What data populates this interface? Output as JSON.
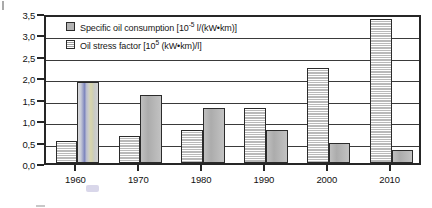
{
  "chart_data": {
    "type": "bar",
    "title": "",
    "subtitle": "",
    "xlabel": "",
    "ylabel": "",
    "categories": [
      "1960",
      "1970",
      "1980",
      "1990",
      "2000",
      "2010"
    ],
    "series": [
      {
        "name": "Oil stress factor [10⁵ (kW•km)/l]",
        "pattern": "striped",
        "values": [
          0.52,
          0.63,
          0.78,
          1.28,
          2.22,
          3.35
        ]
      },
      {
        "name": "Specific oil consumption [10⁻⁵ l/(kW•km)]",
        "pattern": "solid",
        "values": [
          1.88,
          1.58,
          1.28,
          0.78,
          0.47,
          0.3
        ]
      }
    ],
    "ylim": [
      0.0,
      3.5
    ],
    "ytick_values": [
      0.0,
      0.5,
      1.0,
      1.5,
      2.0,
      2.5,
      3.0,
      3.5
    ],
    "ytick_labels": [
      "0,0",
      "0,5",
      "1,0",
      "1,5",
      "2,0",
      "2,5",
      "3,0",
      "3,5"
    ],
    "grid": true,
    "grid_axis": "y",
    "legend_position": "top-left",
    "decimal_separator": ","
  },
  "legend": {
    "items": [
      {
        "id": "legend-specific-oil-consumption",
        "swatch": "solid",
        "text_before": "Specific oil consumption [10",
        "exponent": "-5",
        "text_after": " l/(kW•km)]"
      },
      {
        "id": "legend-oil-stress-factor",
        "swatch": "striped",
        "text_before": "Oil stress factor [10",
        "exponent": "5",
        "text_after": " (kW•km)/l]"
      }
    ]
  },
  "axes": {
    "y": {
      "labels": [
        "3,5",
        "3,0",
        "2,5",
        "2,0",
        "1,5",
        "1,0",
        "0,5",
        "0,0"
      ]
    },
    "x": {
      "labels": [
        "1960",
        "1970",
        "1980",
        "1990",
        "2000",
        "2010"
      ]
    }
  }
}
